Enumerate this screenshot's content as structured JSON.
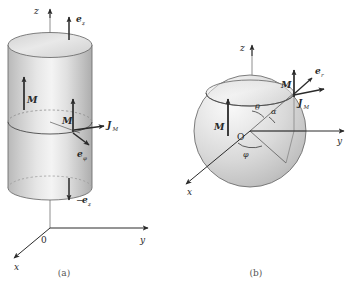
{
  "figure": {
    "title_caption_a": "(a)",
    "title_caption_b": "(b)",
    "background_color": "#ffffff",
    "ink_color": "#2a2a2a",
    "surface_light": "#f2f2f2",
    "surface_mid": "#d8d8d8",
    "surface_dark": "#b4b4b4"
  },
  "panel_a": {
    "name": "uniformly-magnetized-cylinder",
    "shape": "cylinder",
    "axes": {
      "z_label": "z",
      "y_label": "y",
      "x_label": "x",
      "origin_label": "0"
    },
    "vectors": [
      {
        "id": "e_z_top",
        "label": "e",
        "sub": "z",
        "prefix": "",
        "direction": "up",
        "desc": "unit vector along +z at top face"
      },
      {
        "id": "M_left",
        "label": "M",
        "sub": "",
        "prefix": "",
        "direction": "up",
        "desc": "magnetization inside cylinder body"
      },
      {
        "id": "M_center",
        "label": "M",
        "sub": "",
        "prefix": "",
        "direction": "up",
        "desc": "magnetization at mid-height rim point"
      },
      {
        "id": "J_M",
        "label": "J",
        "sub": "M",
        "prefix": "",
        "direction": "right",
        "desc": "bound surface current density, azimuthal"
      },
      {
        "id": "e_phi",
        "label": "e",
        "sub": "φ",
        "prefix": "",
        "direction": "down-right",
        "desc": "azimuthal unit vector"
      },
      {
        "id": "minus_e_z",
        "label": "e",
        "sub": "z",
        "prefix": "−",
        "direction": "down",
        "desc": "negative z unit vector at bottom face"
      }
    ]
  },
  "panel_b": {
    "name": "uniformly-magnetized-sphere",
    "shape": "sphere",
    "axes": {
      "z_label": "z",
      "y_label": "y",
      "x_label": "x",
      "origin_label": "O"
    },
    "angles": [
      {
        "id": "theta",
        "label": "θ",
        "desc": "polar angle from z axis"
      },
      {
        "id": "alpha",
        "label": "α",
        "desc": "angle between radius and z axis"
      },
      {
        "id": "phi",
        "label": "φ",
        "desc": "azimuthal angle in xy plane"
      }
    ],
    "vectors": [
      {
        "id": "M_left",
        "label": "M",
        "sub": "",
        "direction": "up",
        "desc": "uniform magnetization inside sphere"
      },
      {
        "id": "M_top",
        "label": "M",
        "sub": "",
        "direction": "up",
        "desc": "magnetization at surface point"
      },
      {
        "id": "e_r",
        "label": "e",
        "sub": "r",
        "direction": "up-right",
        "desc": "radial unit vector at surface point"
      },
      {
        "id": "J_M",
        "label": "J",
        "sub": "M",
        "direction": "right",
        "desc": "bound surface current density"
      }
    ]
  }
}
